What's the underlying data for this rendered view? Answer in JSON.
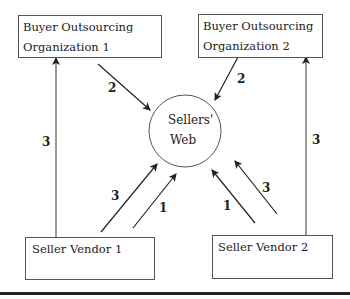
{
  "diagram": {
    "nodes": {
      "buyer1": {
        "line1": "Buyer Outsourcing",
        "line2": "Organization 1"
      },
      "buyer2": {
        "line1": "Buyer Outsourcing",
        "line2": "Organization 2"
      },
      "web": {
        "line1": "Sellers'",
        "line2": "Web"
      },
      "seller1": {
        "label": "Seller Vendor 1"
      },
      "seller2": {
        "label": "Seller Vendor 2"
      }
    },
    "edges": [
      {
        "from": "buyer1",
        "to": "web",
        "label": "2"
      },
      {
        "from": "buyer2",
        "to": "web",
        "label": "2"
      },
      {
        "from": "seller1",
        "to": "buyer1",
        "label": "3"
      },
      {
        "from": "seller2",
        "to": "buyer2",
        "label": "3"
      },
      {
        "from": "seller1",
        "to": "web",
        "label": "3"
      },
      {
        "from": "seller1",
        "to": "web",
        "label": "1"
      },
      {
        "from": "seller2",
        "to": "web",
        "label": "1"
      },
      {
        "from": "seller2",
        "to": "web",
        "label": "3"
      }
    ]
  }
}
